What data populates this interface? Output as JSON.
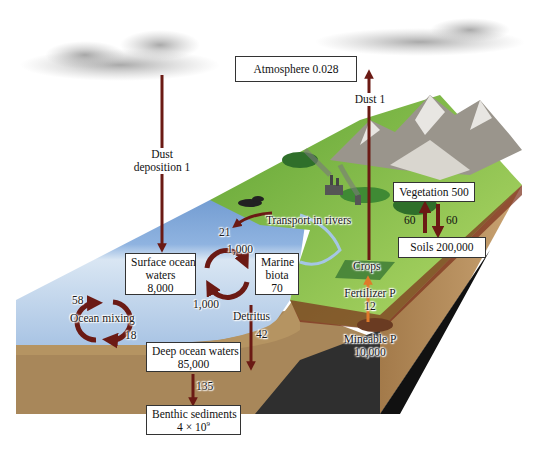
{
  "colors": {
    "flow_arrow": "#6b1a14",
    "fertilizer_arrow": "#e07a2a",
    "ocean_surface": "#7fa6d6",
    "ocean_deep": "#c9dcef",
    "land": "#8cc04a",
    "sediment": "#a8875a",
    "bedrock": "#2a2a2a"
  },
  "pools": {
    "atmosphere": {
      "label": "Atmosphere 0.028"
    },
    "surface_ocean": {
      "line1": "Surface ocean",
      "line2": "waters",
      "value": "8,000"
    },
    "marine_biota": {
      "line1": "Marine",
      "line2": "biota",
      "value": "70"
    },
    "deep_ocean": {
      "line1": "Deep ocean waters",
      "value": "85,000"
    },
    "benthic": {
      "line1": "Benthic sediments",
      "value_base": "4 × 10",
      "value_exp": "9"
    },
    "vegetation": {
      "label": "Vegetation 500"
    },
    "soils": {
      "label": "Soils 200,000"
    },
    "mineable": {
      "line1": "Mineable P",
      "value": "10,000"
    }
  },
  "fluxes": {
    "dust_deposition": {
      "line1": "Dust",
      "line2": "deposition 1"
    },
    "dust_up": {
      "label": "Dust 1"
    },
    "river_transport": {
      "label": "Transport in rivers",
      "value": "21"
    },
    "biota_uptake": {
      "value": "1,000"
    },
    "biota_release": {
      "value": "1,000"
    },
    "ocean_mixing": {
      "label": "Ocean mixing",
      "up": "58",
      "down": "18"
    },
    "detritus": {
      "label": "Detritus",
      "value": "42"
    },
    "burial": {
      "value": "135"
    },
    "veg_to_soil": {
      "up": "60",
      "down": "60"
    },
    "crops": {
      "label": "Crops"
    },
    "fertilizer": {
      "label": "Fertilizer P",
      "value": "12"
    }
  }
}
